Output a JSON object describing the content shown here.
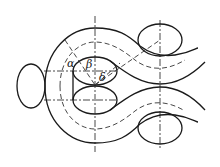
{
  "diagram": {
    "type": "geometric line drawing",
    "labels": [
      {
        "id": "alpha",
        "text": "α"
      },
      {
        "id": "beta",
        "text": "β"
      },
      {
        "id": "delta",
        "text": "δ"
      }
    ],
    "colors": {
      "line": "#1a1a1a",
      "background": "#ffffff"
    }
  }
}
